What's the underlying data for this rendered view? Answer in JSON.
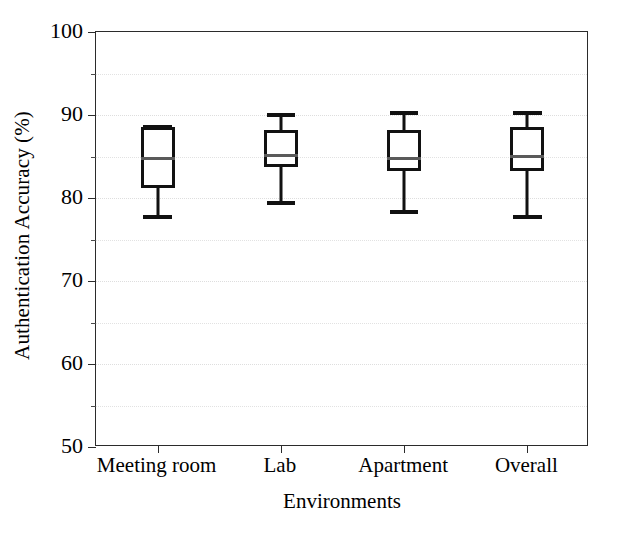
{
  "chart_data": {
    "type": "box",
    "title": "",
    "xlabel": "Environments",
    "ylabel": "Authentication Accuracy (%)",
    "ylim": [
      50,
      100
    ],
    "ytick_major": [
      50,
      60,
      70,
      80,
      90,
      100
    ],
    "ytick_minor": [
      55,
      65,
      75,
      85,
      95
    ],
    "ytick_labels": [
      "50",
      "60",
      "70",
      "80",
      "90",
      "100"
    ],
    "grid": true,
    "grid_axis": "y",
    "legend": "none",
    "categories": [
      "Meeting room",
      "Lab",
      "Apartment",
      "Overall"
    ],
    "boxes": [
      {
        "category": "Meeting room",
        "whisker_low": 77.9,
        "q1": 81.2,
        "median": 85.0,
        "q3": 88.6,
        "whisker_high": 88.8
      },
      {
        "category": "Lab",
        "whisker_low": 79.6,
        "q1": 83.7,
        "median": 85.3,
        "q3": 88.2,
        "whisker_high": 90.2
      },
      {
        "category": "Apartment",
        "whisker_low": 78.6,
        "q1": 83.3,
        "median": 84.9,
        "q3": 88.2,
        "whisker_high": 90.5
      },
      {
        "category": "Overall",
        "whisker_low": 78.0,
        "q1": 83.2,
        "median": 85.2,
        "q3": 88.5,
        "whisker_high": 90.5
      }
    ],
    "colors": {
      "box_edge": "#111111",
      "median": "#5a5a5a",
      "whisker": "#111111",
      "frame": "#2b2b2b",
      "grid": "#e2e2e2",
      "background": "#ffffff"
    }
  }
}
